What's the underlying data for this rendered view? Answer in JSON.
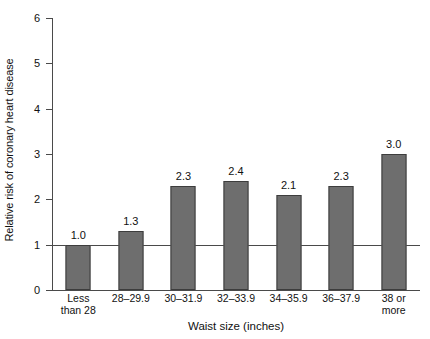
{
  "chart_data": {
    "type": "bar",
    "title": "",
    "xlabel": "Waist size (inches)",
    "ylabel": "Relative risk of coronary heart disease",
    "categories": [
      "Less than 28",
      "28–29.9",
      "30–31.9",
      "32–33.9",
      "34–35.9",
      "36–37.9",
      "38 or more"
    ],
    "category_lines": [
      [
        "Less",
        "than 28"
      ],
      [
        "28–29.9",
        ""
      ],
      [
        "30–31.9",
        ""
      ],
      [
        "32–33.9",
        ""
      ],
      [
        "34–35.9",
        ""
      ],
      [
        "36–37.9",
        ""
      ],
      [
        "38 or",
        "more"
      ]
    ],
    "values": [
      1.0,
      1.3,
      2.3,
      2.4,
      2.1,
      2.3,
      3.0
    ],
    "value_labels": [
      "1.0",
      "1.3",
      "2.3",
      "2.4",
      "2.1",
      "2.3",
      "3.0"
    ],
    "ylim": [
      0,
      6
    ],
    "ytick_labels": [
      "0",
      "1",
      "2",
      "3",
      "4",
      "5",
      "6"
    ],
    "yticks": [
      0,
      1,
      2,
      3,
      4,
      5,
      6
    ],
    "grid": false,
    "legend": "none",
    "reference_line": 1.0,
    "bar_color": "#6e6e6e",
    "bar_edge_color": "#3d3d3d",
    "axis_color": "#4a4a4a",
    "background_color": "#ffffff"
  }
}
